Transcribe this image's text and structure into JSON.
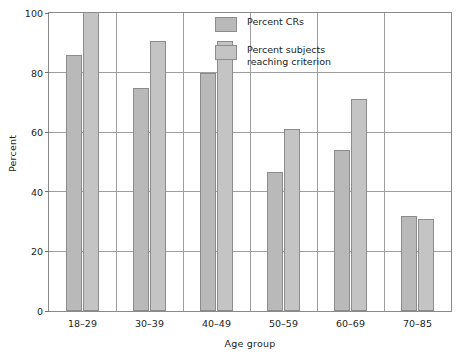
{
  "chart_data": {
    "type": "bar",
    "title": "",
    "xlabel": "Age group",
    "ylabel": "Percent",
    "categories": [
      "18–29",
      "30–39",
      "40–49",
      "50–59",
      "60–69",
      "70–85"
    ],
    "series": [
      {
        "name": "Percent CRs",
        "values": [
          86,
          75,
          80,
          46.5,
          54,
          32
        ]
      },
      {
        "name": "Percent subjects reaching criterion",
        "values": [
          100,
          90.5,
          90.5,
          61,
          71,
          31
        ]
      }
    ],
    "ylim": [
      0,
      100
    ],
    "yticks": [
      0,
      20,
      40,
      60,
      80,
      100
    ],
    "ytick_labels": [
      "0",
      "20",
      "40",
      "60",
      "80",
      "100"
    ],
    "grid": "horizontal-and-category-dividers",
    "legend_position": "top-right-inside"
  },
  "legend": {
    "entries": [
      {
        "label": "Percent CRs",
        "color": "#b9b9b9"
      },
      {
        "label": "Percent subjects\nreaching criterion",
        "color": "#c4c4c4"
      }
    ]
  },
  "axes": {
    "y_label": "Percent",
    "x_label": "Age group"
  },
  "colors": {
    "series_1_fill": "#b9b9b9",
    "series_2_fill": "#c4c4c4",
    "bar_border": "#8c8c8c",
    "grid": "#9e9e9e",
    "frame": "#8a8a8a",
    "text": "#1d1d1d",
    "background": "#ffffff"
  }
}
